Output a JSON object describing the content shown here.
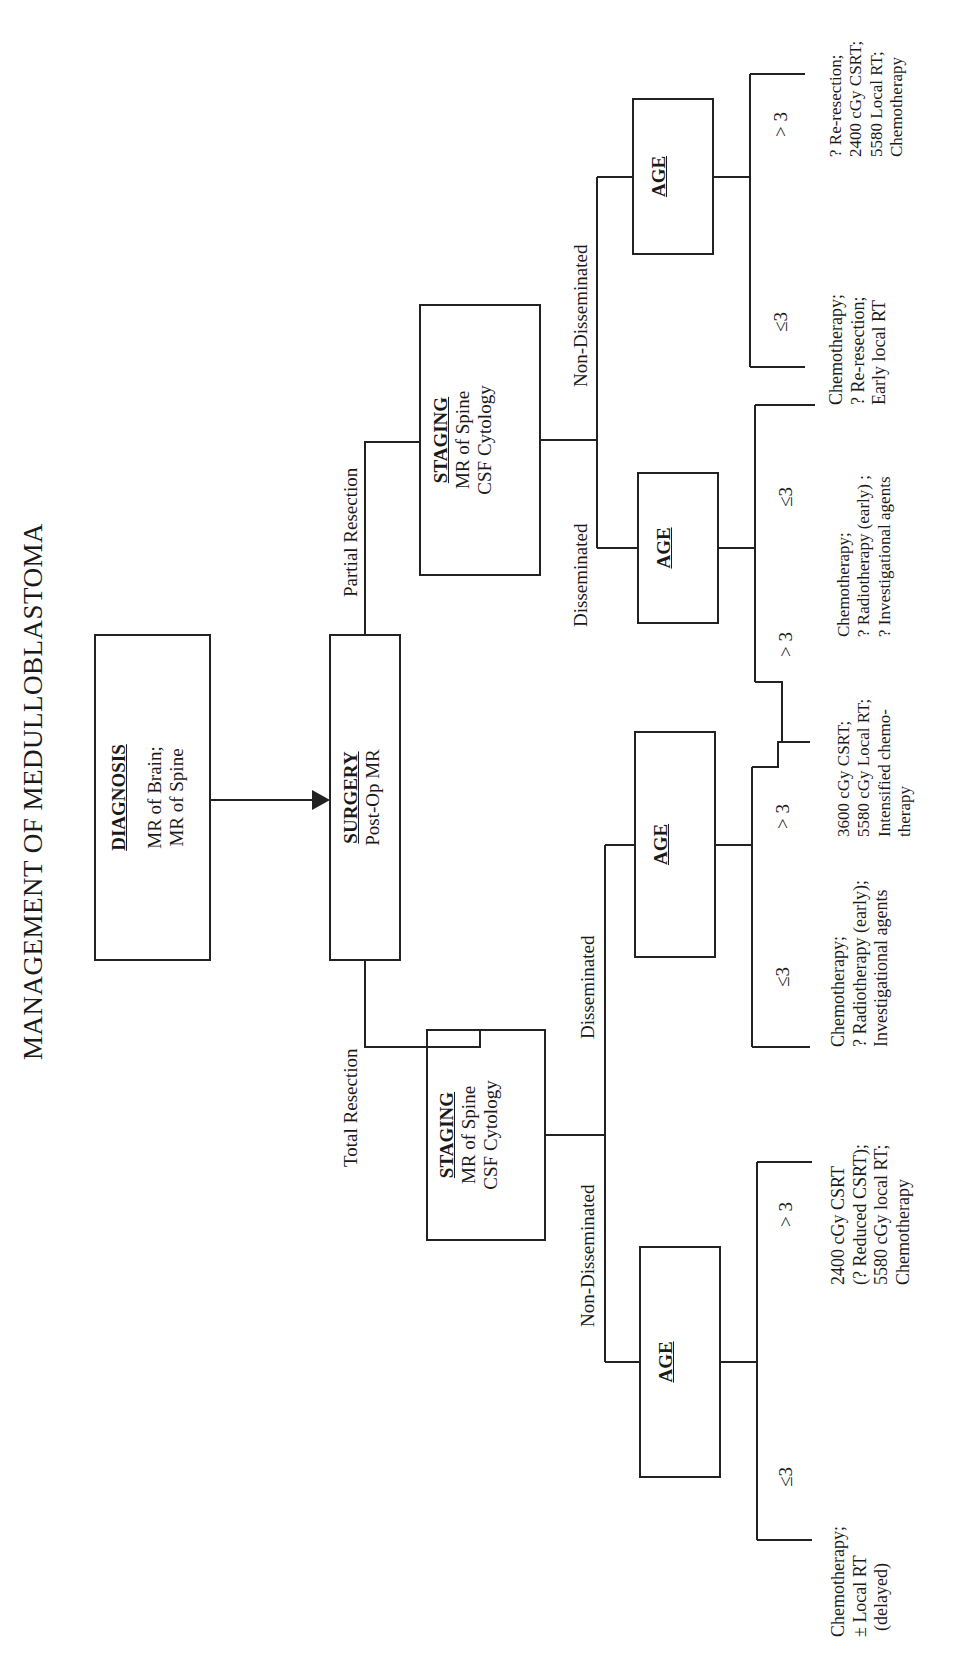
{
  "title": "MANAGEMENT OF MEDULLOBLASTOMA",
  "nodes": {
    "diagnosis": {
      "heading": "DIAGNOSIS",
      "lines": [
        "MR of Brain;",
        "MR of Spine"
      ]
    },
    "surgery": {
      "heading": "SURGERY",
      "lines": [
        "Post-Op MR"
      ]
    },
    "staging_total": {
      "heading": "STAGING",
      "lines": [
        "MR of Spine",
        "CSF Cytology"
      ]
    },
    "staging_partial": {
      "heading": "STAGING",
      "lines": [
        "MR of Spine",
        "CSF Cytology"
      ]
    },
    "age_total_nondissem": {
      "heading": "AGE"
    },
    "age_total_dissem": {
      "heading": "AGE"
    },
    "age_partial_dissem": {
      "heading": "AGE"
    },
    "age_partial_nondissem": {
      "heading": "AGE"
    }
  },
  "edges": {
    "total_resection": "Total Resection",
    "partial_resection": "Partial Resection",
    "total_non_disseminated": "Non-Disseminated",
    "total_disseminated": "Disseminated",
    "partial_disseminated": "Disseminated",
    "partial_non_disseminated": "Non-Disseminated",
    "le3": "≤3",
    "gt3": "> 3"
  },
  "leaves": {
    "total_nondissem_le3": [
      "Chemotherapy;",
      "± Local RT",
      "(delayed)"
    ],
    "total_nondissem_gt3": [
      "2400 cGy CSRT",
      "(? Reduced CSRT);",
      "5580 cGy local RT;",
      "Chemotherapy"
    ],
    "total_dissem_le3": [
      "Chemotherapy;",
      "? Radiotherapy (early);",
      "Investigational agents"
    ],
    "dissem_gt3_shared": [
      "3600 cGy CSRT;",
      "5580 cGy Local RT;",
      "Intensified chemo-",
      "therapy"
    ],
    "partial_dissem_le3": [
      "Chemotherapy;",
      "? Radiotherapy (early) ;",
      "? Investigational  agents"
    ],
    "partial_nondissem_le3": [
      "Chemotherapy;",
      "? Re-resection;",
      "Early local RT"
    ],
    "partial_nondissem_gt3": [
      "? Re-resection;",
      "2400 cGy CSRT;",
      "5580 Local RT;",
      "Chemotherapy"
    ]
  }
}
